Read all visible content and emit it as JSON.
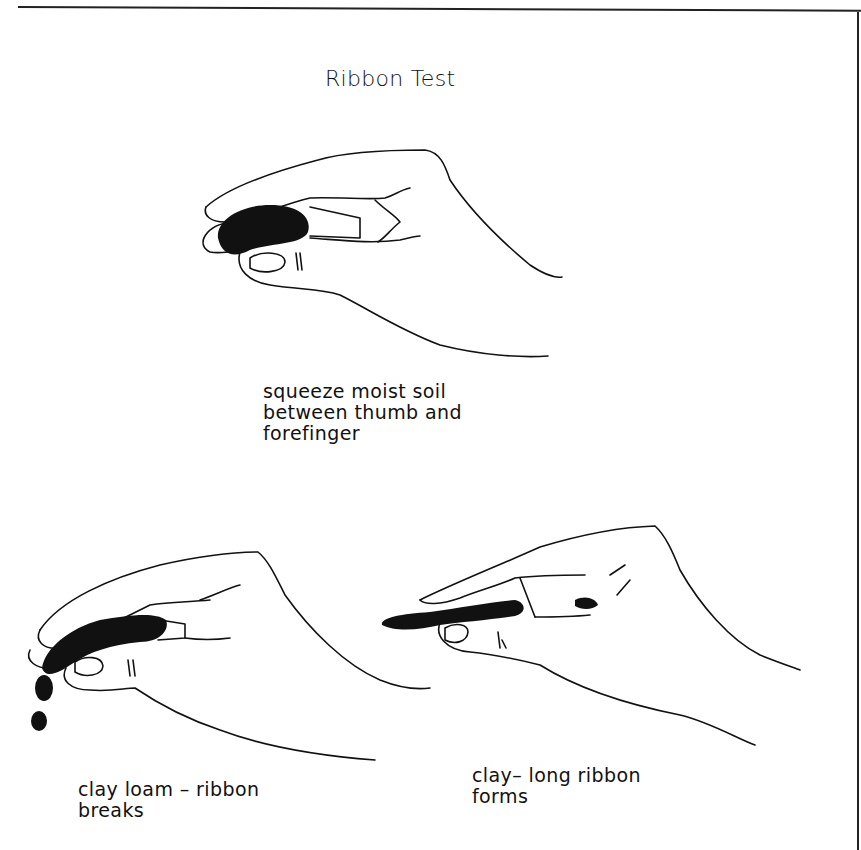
{
  "title": "Ribbon Test",
  "panels": [
    {
      "id": "squeeze",
      "illustration": "hand squeezing moist soil between thumb and forefinger",
      "caption_lines": [
        "squeeze moist soil",
        "between thumb and",
        "forefinger"
      ]
    },
    {
      "id": "clay-loam",
      "illustration": "hand pressing soil into short ribbon that breaks off into drops",
      "caption_lines": [
        "clay loam – ribbon",
        "breaks"
      ]
    },
    {
      "id": "clay",
      "illustration": "hand pressing soil into long continuous ribbon",
      "caption_lines": [
        "clay– long ribbon",
        "forms"
      ]
    }
  ],
  "colors": {
    "ink": "#111111",
    "paper": "#ffffff"
  }
}
